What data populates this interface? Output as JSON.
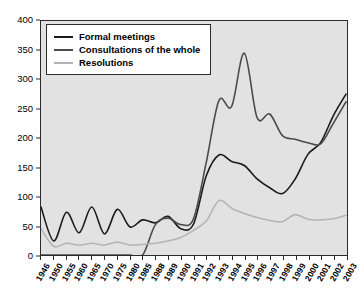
{
  "chart_data": {
    "type": "line",
    "title": "",
    "xlabel": "",
    "ylabel": "",
    "ylim": [
      0,
      400
    ],
    "ytick_values": [
      0,
      50,
      100,
      150,
      200,
      250,
      300,
      350,
      400
    ],
    "grid": false,
    "legend_position": "top-left",
    "categories": [
      "1946",
      "1950",
      "1955",
      "1960",
      "1965",
      "1970",
      "1975",
      "1980",
      "1985",
      "1988",
      "1989",
      "1990",
      "1991",
      "1992",
      "1993",
      "1994",
      "1995",
      "1996",
      "1997",
      "1998",
      "1999",
      "2000",
      "2001",
      "2002",
      "2003"
    ],
    "series": [
      {
        "name": "Formal meetings",
        "color": "#1a1a1a",
        "values": [
          82,
          24,
          73,
          38,
          82,
          36,
          78,
          48,
          60,
          55,
          66,
          45,
          53,
          135,
          171,
          160,
          153,
          130,
          115,
          105,
          130,
          172,
          192,
          238,
          275
        ]
      },
      {
        "name": "Consultations of the whole",
        "color": "#4a4a4a",
        "values": [
          0,
          0,
          0,
          0,
          0,
          0,
          0,
          0,
          0,
          52,
          63,
          52,
          62,
          158,
          264,
          254,
          345,
          235,
          241,
          204,
          198,
          192,
          190,
          225,
          262
        ]
      },
      {
        "name": "Resolutions",
        "color": "#b4b4b4",
        "values": [
          45,
          15,
          20,
          17,
          20,
          17,
          22,
          17,
          18,
          20,
          24,
          30,
          42,
          58,
          93,
          80,
          71,
          64,
          59,
          57,
          69,
          61,
          60,
          62,
          68
        ]
      }
    ]
  },
  "legend": {
    "items": [
      {
        "label": "Formal meetings",
        "color": "#1a1a1a"
      },
      {
        "label": "Consultations of the whole",
        "color": "#4a4a4a"
      },
      {
        "label": "Resolutions",
        "color": "#b4b4b4"
      }
    ]
  },
  "colors": {
    "plot_background": "#e2e2e2",
    "axis": "#2b2b2b",
    "page_background": "#ffffff"
  }
}
